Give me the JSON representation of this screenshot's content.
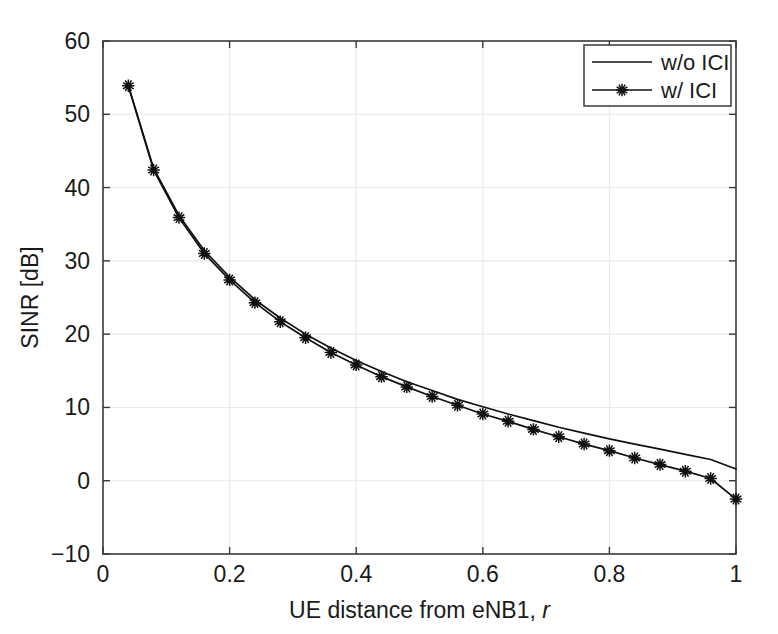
{
  "chart_data": {
    "type": "line",
    "title": "",
    "xlabel": "UE distance from eNB1, r",
    "xlabel_main": "UE distance from eNB1,",
    "xlabel_italic": "r",
    "ylabel": "SINR [dB]",
    "xlim": [
      0,
      1
    ],
    "ylim": [
      -10,
      60
    ],
    "xticks": [
      0,
      0.2,
      0.4,
      0.6,
      0.8,
      1
    ],
    "xtick_labels": [
      "0",
      "0.2",
      "0.4",
      "0.6",
      "0.8",
      "1"
    ],
    "yticks": [
      -10,
      0,
      10,
      20,
      30,
      40,
      50,
      60
    ],
    "ytick_labels": [
      "-10",
      "0",
      "10",
      "20",
      "30",
      "40",
      "50",
      "60"
    ],
    "grid": true,
    "legend_position": "top-right",
    "line_color": "#101010",
    "marker": "asterisk",
    "x": [
      0.04,
      0.08,
      0.12,
      0.16,
      0.2,
      0.24,
      0.28,
      0.32,
      0.36,
      0.4,
      0.44,
      0.48,
      0.52,
      0.56,
      0.6,
      0.64,
      0.68,
      0.72,
      0.76,
      0.8,
      0.84,
      0.88,
      0.92,
      0.96,
      1.0
    ],
    "series": [
      {
        "name": "w/o ICI",
        "marker": "none",
        "values": [
          53.9,
          42.6,
          36.2,
          31.4,
          27.8,
          24.7,
          22.2,
          20.0,
          18.1,
          16.4,
          14.9,
          13.5,
          12.3,
          11.1,
          10.1,
          9.1,
          8.2,
          7.3,
          6.5,
          5.7,
          5.0,
          4.3,
          3.6,
          2.9,
          1.6
        ]
      },
      {
        "name": "w/ ICI",
        "marker": "asterisk",
        "values": [
          53.9,
          42.4,
          35.9,
          31.0,
          27.4,
          24.3,
          21.7,
          19.5,
          17.5,
          15.8,
          14.2,
          12.8,
          11.5,
          10.3,
          9.1,
          8.1,
          7.0,
          6.0,
          5.0,
          4.1,
          3.1,
          2.2,
          1.3,
          0.3,
          -2.5
        ]
      }
    ],
    "legend": [
      {
        "label": "w/o ICI",
        "marker": "none"
      },
      {
        "label": "w/ ICI",
        "marker": "asterisk"
      }
    ]
  },
  "plot_geometry": {
    "left": 103,
    "right": 736,
    "top": 41,
    "bottom": 554
  }
}
